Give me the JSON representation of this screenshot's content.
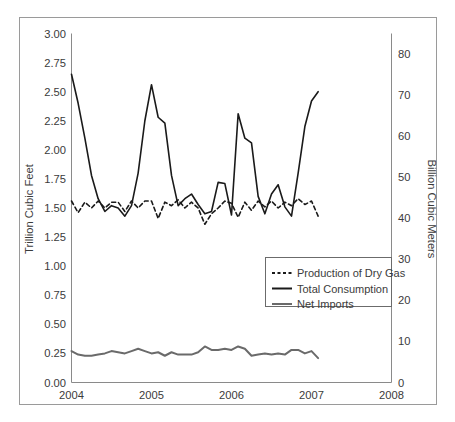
{
  "figure": {
    "frame_color": "#9a9a9a",
    "background": "#ffffff"
  },
  "chart_data": {
    "type": "line",
    "title": "",
    "subtitle": "",
    "xlabel": "",
    "ylabel": "Trillion Cubic Feet",
    "y2label": "Billion Cubic Meters",
    "xlim": [
      2004,
      2008
    ],
    "ylim": [
      0.0,
      3.0
    ],
    "y2lim": [
      0,
      85
    ],
    "grid": false,
    "legend_position": "center-right",
    "x_tick_labels": [
      "2004",
      "2005",
      "2006",
      "2007",
      "2008"
    ],
    "x_ticks": [
      2004,
      2005,
      2006,
      2007,
      2008
    ],
    "y_tick_labels": [
      "0.00",
      "0.25",
      "0.50",
      "0.75",
      "1.00",
      "1.25",
      "1.50",
      "1.75",
      "2.00",
      "2.25",
      "2.50",
      "2.75",
      "3.00"
    ],
    "y_ticks": [
      0.0,
      0.25,
      0.5,
      0.75,
      1.0,
      1.25,
      1.5,
      1.75,
      2.0,
      2.25,
      2.5,
      2.75,
      3.0
    ],
    "y2_tick_labels": [
      "0",
      "10",
      "20",
      "30",
      "40",
      "50",
      "60",
      "70",
      "80"
    ],
    "y2_ticks": [
      0,
      10,
      20,
      30,
      40,
      50,
      60,
      70,
      80
    ],
    "x": [
      2004.0,
      2004.083,
      2004.167,
      2004.25,
      2004.333,
      2004.417,
      2004.5,
      2004.583,
      2004.667,
      2004.75,
      2004.833,
      2004.917,
      2005.0,
      2005.083,
      2005.167,
      2005.25,
      2005.333,
      2005.417,
      2005.5,
      2005.583,
      2005.667,
      2005.75,
      2005.833,
      2005.917,
      2006.0,
      2006.083,
      2006.167,
      2006.25,
      2006.333,
      2006.417,
      2006.5,
      2006.583,
      2006.667,
      2006.75,
      2006.833,
      2006.917,
      2007.0,
      2007.083
    ],
    "series": [
      {
        "name": "Production of Dry Gas",
        "style": "dashed",
        "color": "#1a1a1a",
        "width": 1.6,
        "values": [
          1.56,
          1.46,
          1.55,
          1.5,
          1.56,
          1.5,
          1.55,
          1.55,
          1.47,
          1.56,
          1.5,
          1.56,
          1.56,
          1.41,
          1.55,
          1.52,
          1.57,
          1.5,
          1.55,
          1.5,
          1.36,
          1.45,
          1.5,
          1.56,
          1.54,
          1.42,
          1.55,
          1.48,
          1.56,
          1.51,
          1.56,
          1.5,
          1.55,
          1.52,
          1.58,
          1.53,
          1.56,
          1.43
        ]
      },
      {
        "name": "Total Consumption",
        "style": "solid",
        "color": "#1a1a1a",
        "width": 1.6,
        "values": [
          2.65,
          2.4,
          2.1,
          1.78,
          1.58,
          1.47,
          1.52,
          1.5,
          1.43,
          1.52,
          1.8,
          2.25,
          2.56,
          2.28,
          2.23,
          1.78,
          1.52,
          1.58,
          1.62,
          1.53,
          1.45,
          1.47,
          1.72,
          1.71,
          1.44,
          2.31,
          2.1,
          2.06,
          1.6,
          1.45,
          1.62,
          1.7,
          1.51,
          1.43,
          1.8,
          2.2,
          2.42,
          2.5
        ]
      },
      {
        "name": "Net Imports",
        "style": "solid",
        "color": "#6a6a6a",
        "width": 2.0,
        "values": [
          0.27,
          0.24,
          0.23,
          0.23,
          0.24,
          0.25,
          0.27,
          0.26,
          0.25,
          0.27,
          0.29,
          0.27,
          0.25,
          0.26,
          0.23,
          0.26,
          0.24,
          0.24,
          0.24,
          0.26,
          0.31,
          0.28,
          0.28,
          0.29,
          0.28,
          0.31,
          0.29,
          0.23,
          0.24,
          0.25,
          0.24,
          0.25,
          0.24,
          0.28,
          0.28,
          0.25,
          0.27,
          0.21
        ]
      }
    ]
  },
  "legend": {
    "entries": [
      {
        "label": "Production of Dry Gas",
        "style": "dashed",
        "color": "#1a1a1a"
      },
      {
        "label": "Total Consumption",
        "style": "solid",
        "color": "#1a1a1a"
      },
      {
        "label": "Net Imports",
        "style": "solid",
        "color": "#6a6a6a"
      }
    ]
  }
}
